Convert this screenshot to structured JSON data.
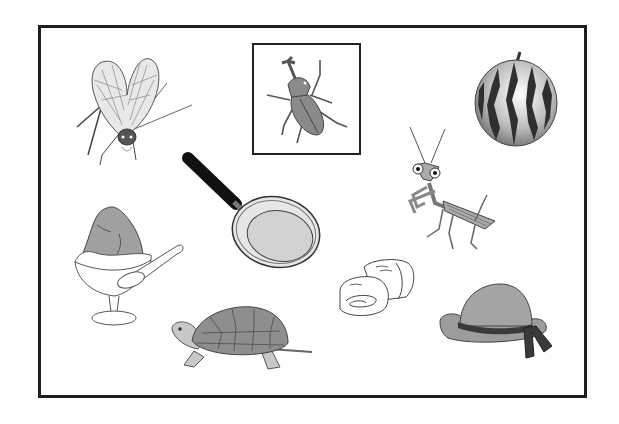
{
  "sheet": {
    "type": "picture-card",
    "colors": {
      "frame": "#1e1e1e",
      "fill_gray": "#9a9a9a",
      "light_gray": "#d4d4d4",
      "dark": "#2a2a2a",
      "background": "#ffffff"
    },
    "items": [
      {
        "id": "cicada",
        "label": "cicada",
        "highlighted": false
      },
      {
        "id": "rhinoceros-beetle",
        "label": "rhinoceros beetle",
        "highlighted": true
      },
      {
        "id": "watermelon",
        "label": "watermelon",
        "highlighted": false
      },
      {
        "id": "frying-pan",
        "label": "frying pan",
        "highlighted": false
      },
      {
        "id": "praying-mantis",
        "label": "praying mantis",
        "highlighted": false
      },
      {
        "id": "shaved-ice",
        "label": "shaved ice",
        "highlighted": false
      },
      {
        "id": "turtle",
        "label": "turtle",
        "highlighted": false
      },
      {
        "id": "rolled-omelette",
        "label": "rolled omelette",
        "highlighted": false
      },
      {
        "id": "hat",
        "label": "hat",
        "highlighted": false
      }
    ]
  }
}
